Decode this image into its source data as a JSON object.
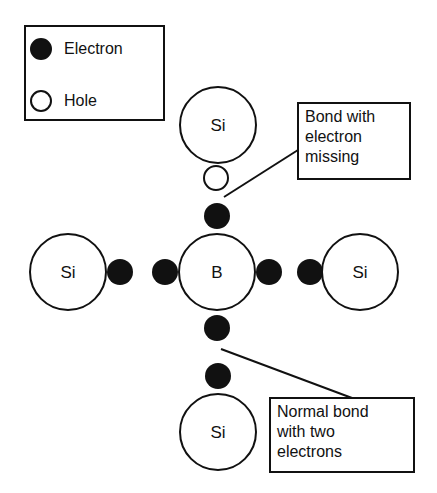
{
  "legend": {
    "items": [
      {
        "symbol": "filled-circle",
        "label": "Electron"
      },
      {
        "symbol": "open-circle",
        "label": "Hole"
      }
    ]
  },
  "atoms": {
    "center": {
      "label": "B"
    },
    "top": {
      "label": "Si"
    },
    "left": {
      "label": "Si"
    },
    "right": {
      "label": "Si"
    },
    "bottom": {
      "label": "Si"
    }
  },
  "callouts": {
    "top": {
      "lines": [
        "Bond with",
        "electron",
        "missing"
      ]
    },
    "bottom": {
      "lines": [
        "Normal bond",
        "with two",
        "electrons"
      ]
    }
  },
  "colors": {
    "ink": "#111111",
    "background": "#ffffff"
  }
}
